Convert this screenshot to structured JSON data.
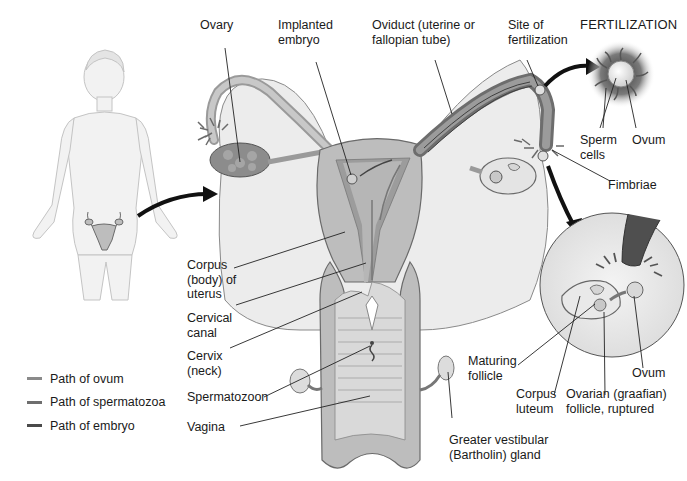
{
  "labels": {
    "ovary": "Ovary",
    "implanted_embryo": "Implanted\nembryo",
    "oviduct": "Oviduct (uterine or\nfallopian tube)",
    "site_of_fertilization": "Site of\nfertilization",
    "fertilization_title": "FERTILIZATION",
    "sperm_cells": "Sperm\ncells",
    "ovum_top": "Ovum",
    "fimbriae": "Fimbriae",
    "corpus_of_uterus": "Corpus\n(body) of\nuterus",
    "cervical_canal": "Cervical\ncanal",
    "cervix": "Cervix\n(neck)",
    "spermatozoon": "Spermatozoon",
    "vagina": "Vagina",
    "greater_vestibular_gland": "Greater vestibular\n(Bartholin) gland",
    "maturing_follicle": "Maturing\nfollicle",
    "corpus_luteum": "Corpus\nluteum",
    "ovarian_follicle_ruptured": "Ovarian (graafian)\nfollicle, ruptured",
    "ovum_inset": "Ovum"
  },
  "legend": {
    "items": [
      {
        "label": "Path of ovum",
        "color": "#8a8a8a"
      },
      {
        "label": "Path of spermatozoa",
        "color": "#6e6e6e"
      },
      {
        "label": "Path of embryo",
        "color": "#4a4a4a"
      }
    ]
  },
  "colors": {
    "tissue_light": "#e9e9e9",
    "tissue_mid": "#bdbdbd",
    "tissue_dark": "#8f8f8f",
    "outline": "#6a6a6a",
    "arrow": "#111111",
    "body_figure": "#f0f0f0"
  }
}
